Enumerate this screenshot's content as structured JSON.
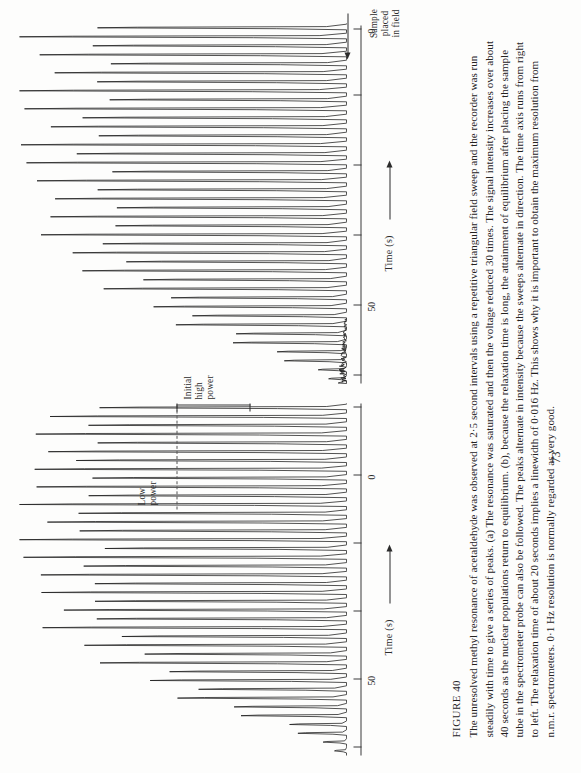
{
  "page": {
    "number": "73",
    "background_color": "#fdfdfc",
    "ink_color": "#1a1a1a",
    "orientation_note": "page rotated 90 degrees counter-clockwise in screenshot"
  },
  "caption": {
    "figure_label": "FIGURE 40",
    "text": "The unresolved methyl resonance of acetaldehyde was observed at 2·5 second intervals using a repetitive triangular field sweep and the recorder was run steadily with time to give a series of peaks. (a) The resonance was saturated and then the voltage reduced 30 times. The signal intensity increases over about 40 seconds as the nuclear populations return to equilibrium. (b), because the relaxation time is long, the attainment of equilibrium after placing the sample tube in the spectrometer probe can also be followed. The peaks alternate in intensity because the sweeps alternate in direction. The time axis runs from right to left. The relaxation time of about 20 seconds implies a linewidth of 0·016 Hz. This shows why it is important to obtain the maximum resolution from n.m.r. spectrometers. 0·1 Hz resolution is normally regarded as very good."
  },
  "figure": {
    "axis_title": "Time (s)",
    "axis_direction_note": "arrow points left (time runs right to left)",
    "annotations": {
      "sample_placed": "Sample\nplaced\nin field",
      "sample_placed_lines": [
        "Sample",
        "placed",
        "in field"
      ],
      "low_power": "Low\npower",
      "low_power_lines": [
        "Low",
        "power"
      ],
      "initial_high_power": "Initial\nhigh\npower",
      "initial_high_power_lines": [
        "Initial",
        "high",
        "power"
      ]
    },
    "panel_a": {
      "id": "a",
      "tick_labels": [
        "50",
        "0"
      ],
      "axis_title": "Time (s)"
    },
    "panel_b": {
      "id": "b",
      "tick_labels": [
        "50",
        "0"
      ],
      "axis_title": "Time (s)"
    }
  },
  "chart_data": {
    "type": "line",
    "xlabel": "Time (s)",
    "ylabel": "Signal intensity (arbitrary units)",
    "xlim": [
      0,
      100
    ],
    "xtick_values": [
      0,
      25,
      50,
      75,
      100
    ],
    "xtick_labels": [
      "0",
      "",
      "50",
      "",
      ""
    ],
    "x_direction": "right-to-left",
    "grid": false,
    "legend": false,
    "sampling_interval_s": 2.5,
    "relaxation_time_s": 20,
    "linewidth_hz": 0.016,
    "series": [
      {
        "name": "(a) saturated resonance recovering — low power then initial high power",
        "panel": "a",
        "note": "peaks alternate in intensity because sweeps alternate in direction; intensity grows over ~40 s",
        "peak_envelope": [
          0.06,
          0.12,
          0.2,
          0.28,
          0.36,
          0.44,
          0.52,
          0.59,
          0.65,
          0.71,
          0.76,
          0.8,
          0.84,
          0.87,
          0.9,
          0.92,
          0.94,
          0.95,
          0.96,
          0.97,
          0.98,
          0.98,
          0.99,
          0.99,
          1.0,
          1.0,
          1.0,
          1.0,
          0.99,
          1.0,
          1.0,
          0.99,
          1.0,
          1.0,
          0.99,
          1.0,
          1.0,
          0.99,
          1.0,
          1.0
        ]
      },
      {
        "name": "(b) relaxation after sample placed in field",
        "panel": "b",
        "note": "time axis runs right to left; sample placed in field at t = 0 on the right",
        "peak_envelope": [
          0.04,
          0.09,
          0.16,
          0.24,
          0.33,
          0.42,
          0.5,
          0.58,
          0.65,
          0.71,
          0.77,
          0.82,
          0.86,
          0.89,
          0.92,
          0.94,
          0.96,
          0.97,
          0.98,
          0.99,
          0.99,
          1.0,
          1.0,
          1.0,
          1.0,
          1.0,
          0.99,
          1.0,
          1.0,
          1.0,
          0.99,
          1.0,
          1.0,
          1.0,
          0.99,
          1.0,
          1.0,
          1.0,
          1.0,
          1.0
        ]
      }
    ]
  }
}
